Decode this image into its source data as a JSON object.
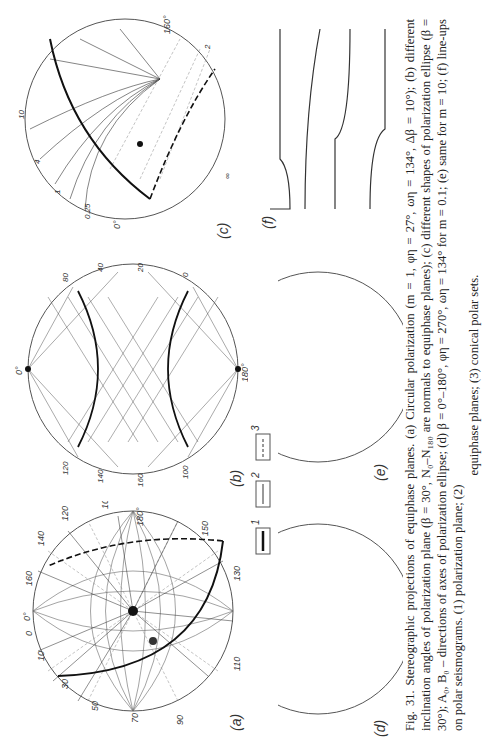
{
  "figure": {
    "panels": [
      {
        "id": "a",
        "label": "(a)",
        "ticks": [
          "90",
          "70",
          "50",
          "30",
          "10",
          "0",
          "0°",
          "160",
          "140",
          "120",
          "100",
          "80",
          "60",
          "40",
          "20",
          "180°",
          "150",
          "130",
          "110"
        ]
      },
      {
        "id": "b",
        "label": "(b)",
        "ticks": [
          "0°",
          "180°",
          "100",
          "120",
          "140",
          "160",
          "80",
          "60",
          "40",
          "20",
          "0",
          "10",
          "30",
          "50",
          "70",
          "90",
          "110",
          "130",
          "150",
          "170"
        ]
      },
      {
        "id": "c",
        "label": "(c)",
        "ticks": [
          "0°",
          "0",
          "0.25",
          "0.5",
          "1",
          "2",
          "4",
          "8",
          "10",
          "∞",
          "160°",
          "A₀",
          "B₀"
        ]
      },
      {
        "id": "d",
        "label": "(d)",
        "ticks": [
          "0°",
          "0",
          "180°",
          "10",
          "20",
          "40",
          "60",
          "80",
          "100",
          "120",
          "140",
          "150",
          "170",
          "130",
          "A₀",
          "m"
        ]
      },
      {
        "id": "e",
        "label": "(e)",
        "ticks": [
          "0°",
          "0",
          "180°",
          "10",
          "20",
          "30",
          "40",
          "50",
          "60",
          "70",
          "80",
          "90",
          "100",
          "110",
          "120",
          "140",
          "160",
          "170",
          "n"
        ]
      },
      {
        "id": "f",
        "label": "(f)",
        "rows": [
          {
            "label": "ψ=30°",
            "curves": [
              "m=10",
              "m=1",
              "m=0.1"
            ],
            "ticks": [
              "0",
              "100",
              "0",
              "100",
              "0",
              "100",
              "120",
              "240",
              "360"
            ],
            "axis": "ω,deg"
          },
          {
            "label": "ψ=70°",
            "curves": [
              "0",
              "100",
              "0",
              "100",
              "0",
              "100"
            ],
            "ticks": [
              "120",
              "240",
              "360"
            ],
            "axis": "ω,deg"
          }
        ]
      }
    ],
    "legend": [
      {
        "num": "1",
        "style": "thick solid"
      },
      {
        "num": "2",
        "style": "thin solid"
      },
      {
        "num": "3",
        "style": "dashed"
      }
    ]
  },
  "caption": {
    "line1": "Fig. 31. Stereographic projections of equiphase planes. (a) Circular polarization (m = 1, φη = 27°, ωη = 134°, Δβ = 10°); (b) different inclination angles of",
    "line2": "polarization plane (β = 30°, N₀–N₁₈₀ are normals to equiphase planes); (c) different shapes of polarization ellipse (β = 30°); A₀, B₀ – directions of axes of",
    "line3": "polarization ellipse; (d) β = 0°–180°, φη = 270°, ωη = 134° for m = 0.1; (e) same for m = 10; (f) line-ups on polar seismograms. (1) polarization plane; (2)",
    "line4": "equiphase planes; (3) conical polar sets."
  }
}
